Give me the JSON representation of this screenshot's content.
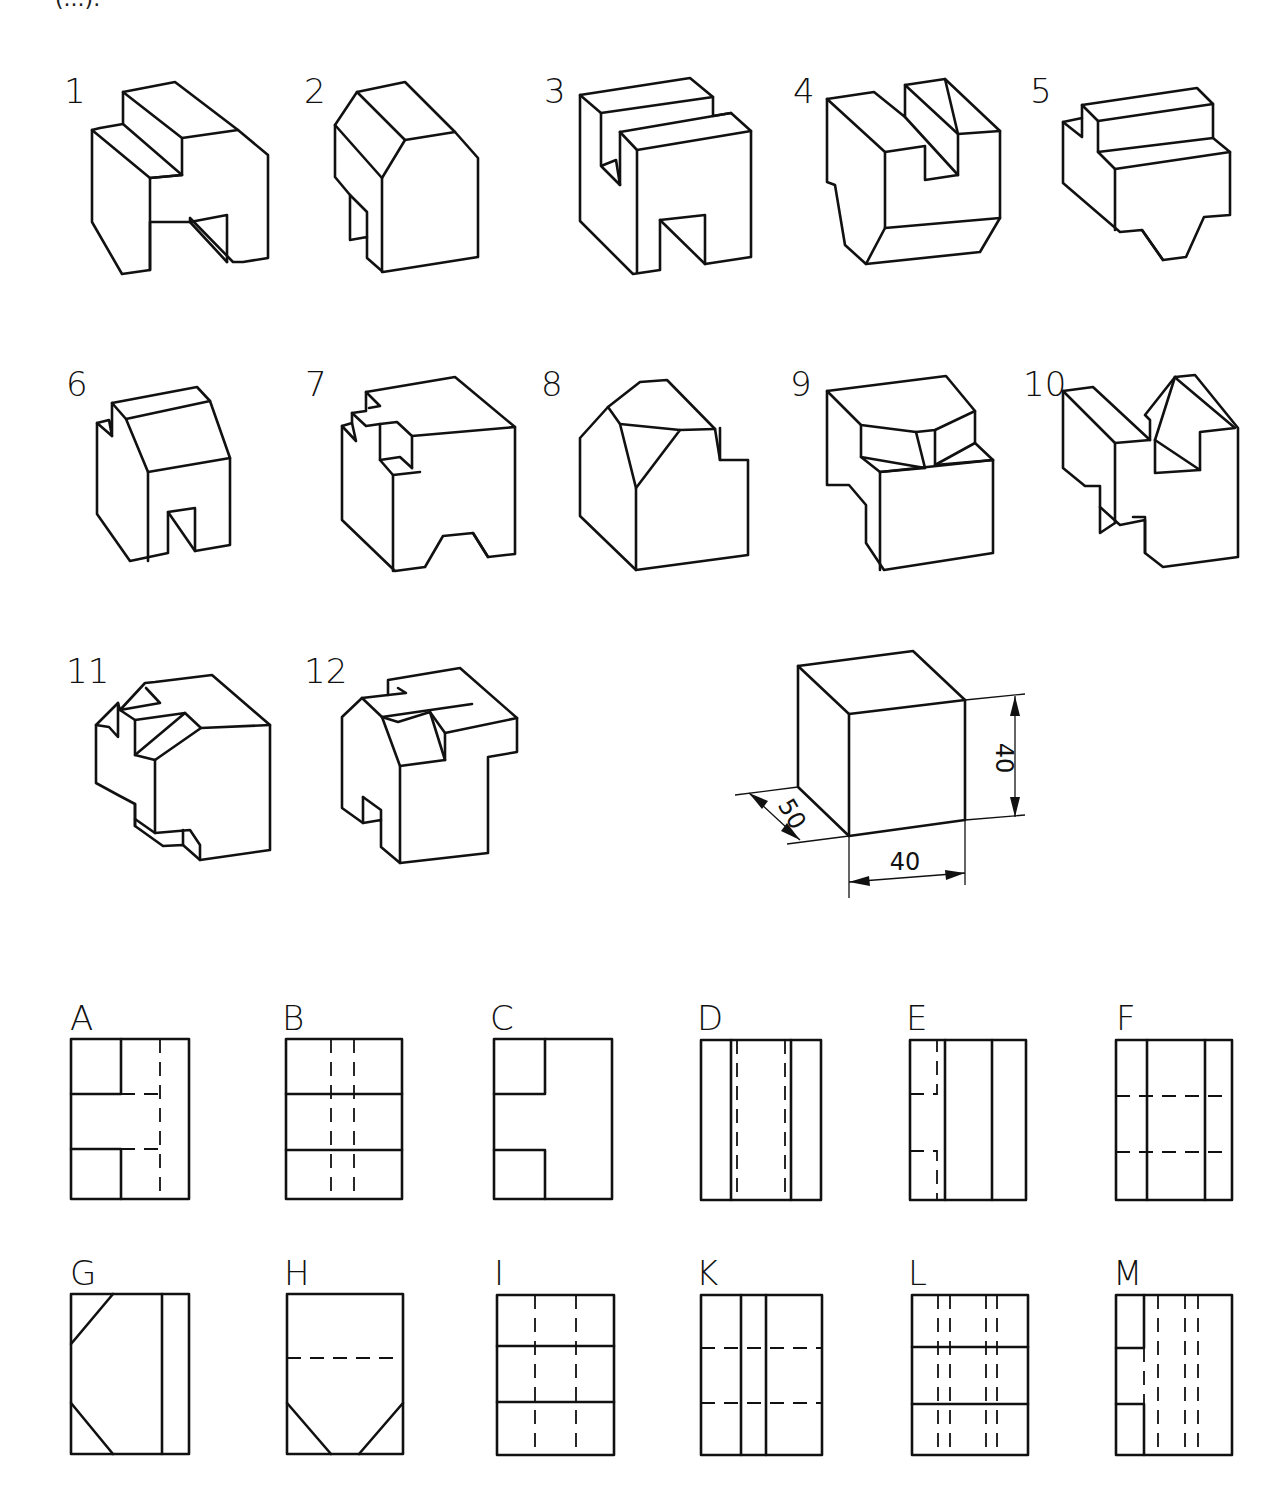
{
  "header": {
    "partial_caption": "(...)."
  },
  "isometric_figures": [
    {
      "number": "1"
    },
    {
      "number": "2"
    },
    {
      "number": "3"
    },
    {
      "number": "4"
    },
    {
      "number": "5"
    },
    {
      "number": "6"
    },
    {
      "number": "7"
    },
    {
      "number": "8"
    },
    {
      "number": "9"
    },
    {
      "number": "10"
    },
    {
      "number": "11"
    },
    {
      "number": "12"
    }
  ],
  "reference_block": {
    "width_dim": "40",
    "height_dim": "40",
    "depth_dim": "50"
  },
  "orthographic_views": [
    {
      "letter": "A"
    },
    {
      "letter": "B"
    },
    {
      "letter": "C"
    },
    {
      "letter": "D"
    },
    {
      "letter": "E"
    },
    {
      "letter": "F"
    },
    {
      "letter": "G"
    },
    {
      "letter": "H"
    },
    {
      "letter": "I"
    },
    {
      "letter": "K"
    },
    {
      "letter": "L"
    },
    {
      "letter": "M"
    }
  ]
}
